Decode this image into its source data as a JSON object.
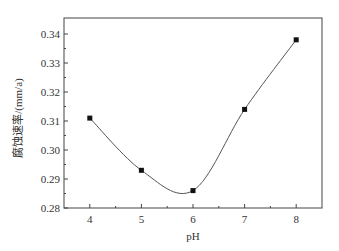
{
  "chart_data": {
    "type": "line",
    "title": "",
    "xlabel": "pH",
    "ylabel": "腐蚀速率/(mm/a)",
    "x": [
      4,
      5,
      6,
      7,
      8
    ],
    "series": [
      {
        "name": "corrosion rate",
        "values": [
          0.311,
          0.293,
          0.286,
          0.314,
          0.338
        ],
        "marker": "square",
        "smooth": true
      }
    ],
    "xlim": [
      3.5,
      8.5
    ],
    "ylim": [
      0.28,
      0.345
    ],
    "xticks": [
      "4",
      "5",
      "6",
      "7",
      "8"
    ],
    "yticks": [
      "0.28",
      "0.29",
      "0.30",
      "0.31",
      "0.32",
      "0.33",
      "0.34"
    ],
    "grid": false,
    "legend": null,
    "curve_minimum_approx": {
      "x": 5.75,
      "y": 0.2845
    }
  },
  "colors": {
    "line": "#555555",
    "marker": "#111111",
    "axis": "#444444"
  }
}
